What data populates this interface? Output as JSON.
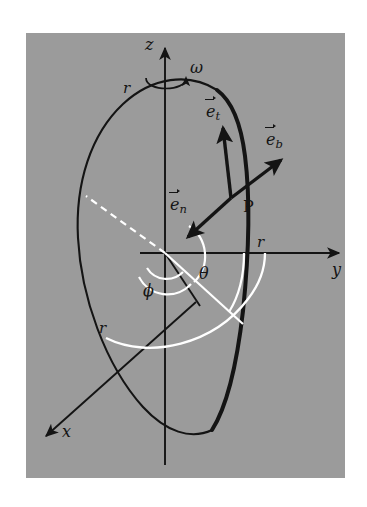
{
  "figure": {
    "kind": "spherical-coordinate-diagram",
    "background_color": "#9b9b9b",
    "page_color": "#ffffff",
    "line_color": "#141414",
    "highlight_color": "#ffffff",
    "axes": {
      "z": {
        "label": "z"
      },
      "y": {
        "label": "y"
      },
      "x": {
        "label": "x"
      }
    },
    "rotation": {
      "label": "ω"
    },
    "angles": {
      "theta": {
        "label": "θ"
      },
      "phi": {
        "label": "ϕ"
      }
    },
    "point": {
      "label": "P"
    },
    "radii": [
      {
        "label": "r",
        "at": "ellipse-top-left"
      },
      {
        "label": "r",
        "at": "y-axis"
      },
      {
        "label": "r",
        "at": "lower-left-arc"
      }
    ],
    "vectors": [
      {
        "name": "e-t",
        "base": "e",
        "sub": "t",
        "direction": "tangential-up"
      },
      {
        "name": "e-b",
        "base": "e",
        "sub": "b",
        "direction": "binormal-up-right"
      },
      {
        "name": "e-n",
        "base": "e",
        "sub": "n",
        "direction": "normal-down-left"
      }
    ]
  }
}
